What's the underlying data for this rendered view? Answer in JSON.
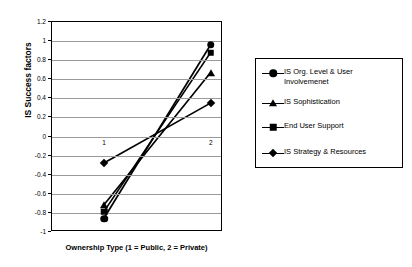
{
  "chart_data": {
    "type": "line",
    "title": "",
    "xlabel": "Ownership Type (1 = Public, 2 = Private)",
    "ylabel": "IS Success factors",
    "categories": [
      "1",
      "2"
    ],
    "x": [
      1,
      2
    ],
    "xtick_labels": [
      "1",
      "2"
    ],
    "ytick_labels": [
      "1.2",
      "1",
      "0.8",
      "0.6",
      "0.4",
      "0.2",
      "0",
      "-0.2",
      "-0.4",
      "-0.6",
      "-0.8",
      "-1"
    ],
    "ylim": [
      -1,
      1.2
    ],
    "ytick_step": 0.2,
    "grid": true,
    "legend_position": "right-outside",
    "series": [
      {
        "name": "IS Org. Level & User Involvemenet",
        "legend_label": "IS Org. Level & User\nInvolvemenet",
        "marker": "circle",
        "color": "#000000",
        "values": [
          -0.87,
          0.95
        ]
      },
      {
        "name": "IS Sophistication",
        "legend_label": "IS Sophistication",
        "marker": "triangle",
        "color": "#000000",
        "values": [
          -0.73,
          0.66
        ]
      },
      {
        "name": "End User Support",
        "legend_label": "End User Support",
        "marker": "square",
        "color": "#000000",
        "values": [
          -0.8,
          0.87
        ]
      },
      {
        "name": "IS Strategy & Resources",
        "legend_label": "IS Strategy & Resources",
        "marker": "diamond",
        "color": "#000000",
        "values": [
          -0.29,
          0.34
        ]
      }
    ]
  },
  "axes": {
    "y_title": "IS Success factors",
    "x_title": "Ownership Type (1 = Public, 2 = Private)"
  },
  "legend": {
    "items": [
      {
        "label": "IS Org. Level & User\nInvolvemenet",
        "marker": "circle"
      },
      {
        "label": "IS Sophistication",
        "marker": "triangle"
      },
      {
        "label": "End User Support",
        "marker": "square"
      },
      {
        "label": "IS Strategy & Resources",
        "marker": "diamond"
      }
    ]
  },
  "colors": {
    "series": "#000000",
    "grid": "#9a9a9a",
    "frame": "#000000",
    "background": "#ffffff"
  }
}
